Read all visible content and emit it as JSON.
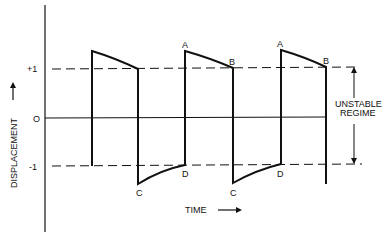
{
  "yaxis": {
    "label": "DISPLACEMENT",
    "ticks": [
      "+1",
      "O",
      "-1"
    ]
  },
  "xaxis": {
    "label": "TIME"
  },
  "points": {
    "A": "A",
    "B": "B",
    "C": "C",
    "D": "D"
  },
  "annotation": {
    "line1": "UNSTABLE",
    "line2": "REGIME"
  },
  "colors": {
    "line": "#111111",
    "background": "#ffffff"
  }
}
